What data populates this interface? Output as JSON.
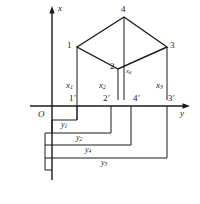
{
  "figure": {
    "type": "descriptive-geometry-projection-diagram",
    "axes": {
      "x_label": "x",
      "y_label": "y",
      "origin_label": "O"
    },
    "vertices": [
      {
        "id": "v1",
        "label": "1",
        "x": 77,
        "y": 47
      },
      {
        "id": "v4",
        "label": "4",
        "x": 124,
        "y": 17
      },
      {
        "id": "v3",
        "label": "3",
        "x": 167,
        "y": 47
      },
      {
        "id": "v2",
        "label": "2",
        "x": 118,
        "y": 69
      }
    ],
    "projection_points": [
      {
        "id": "p1",
        "label": "1",
        "prime": "′",
        "x": 77,
        "y": 106
      },
      {
        "id": "p2",
        "label": "2",
        "prime": "′",
        "x": 111,
        "y": 106
      },
      {
        "id": "p4",
        "label": "4",
        "prime": "′",
        "x": 131,
        "y": 106
      },
      {
        "id": "p3",
        "label": "3",
        "prime": "′",
        "x": 167,
        "y": 106
      }
    ],
    "height_labels": [
      {
        "id": "x1",
        "base": "x",
        "sub": "1",
        "x": 71,
        "y": 87
      },
      {
        "id": "x2",
        "base": "x",
        "sub": "2",
        "x": 104,
        "y": 87
      },
      {
        "id": "x4",
        "base": "x",
        "sub": "4",
        "x": 128,
        "y": 72
      },
      {
        "id": "x3",
        "base": "x",
        "sub": "3",
        "x": 161,
        "y": 87
      }
    ],
    "dimension_labels": [
      {
        "id": "y1",
        "base": "y",
        "sub": "1",
        "x": 64,
        "y": 127
      },
      {
        "id": "y2",
        "base": "y",
        "sub": "2",
        "x": 79,
        "y": 138
      },
      {
        "id": "y4",
        "base": "y",
        "sub": "4",
        "x": 88,
        "y": 151
      },
      {
        "id": "y3",
        "base": "y",
        "sub": "3",
        "x": 104,
        "y": 164
      }
    ],
    "colors": {
      "stroke": "#1a1a1a",
      "background": "#ffffff",
      "caption": "#8d8d8d"
    },
    "caption_text": ""
  }
}
